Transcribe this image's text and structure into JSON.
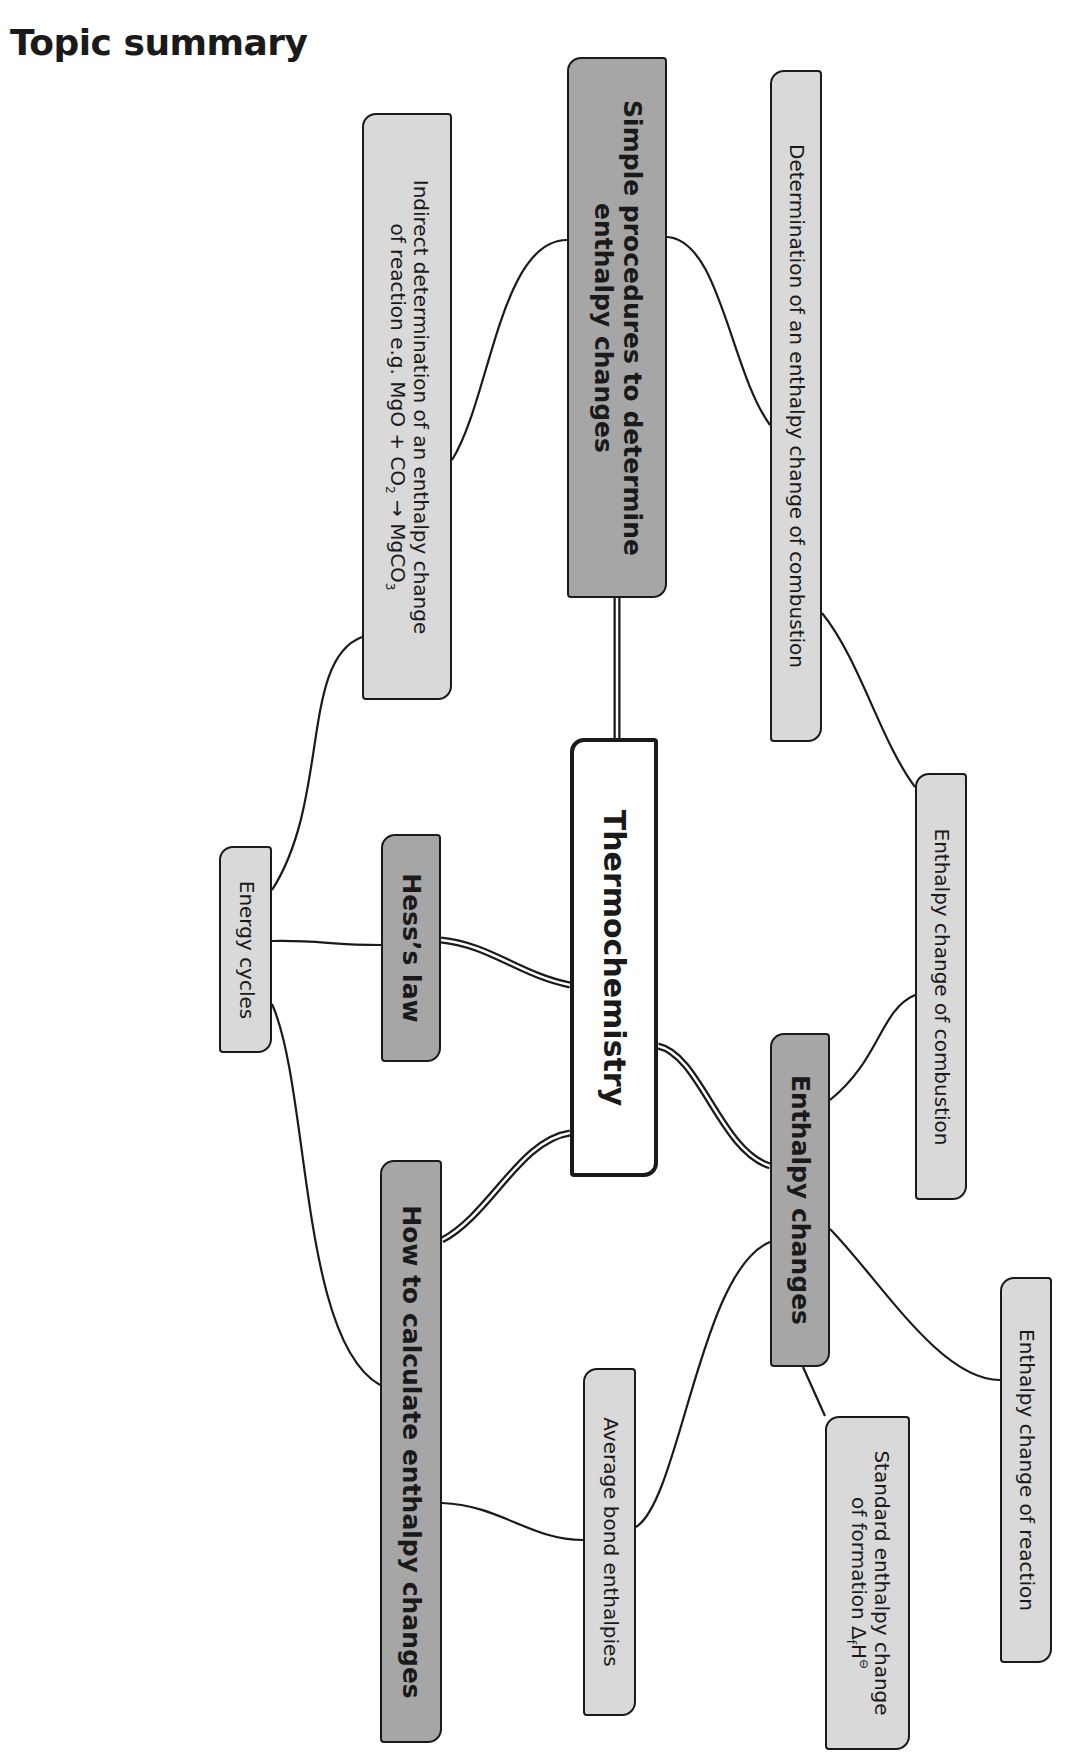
{
  "page": {
    "title": "Topic summary"
  },
  "colors": {
    "dark_node": "#a6a6a6",
    "light_node": "#d9d9d9",
    "main_node": "#ffffff",
    "line": "#1a1a1a"
  },
  "diagram": {
    "central": {
      "label": "Thermochemistry"
    },
    "nodes": {
      "simple_procedures": {
        "line1": "Simple procedures to determine",
        "line2": "enthalpy changes"
      },
      "determination_combustion": {
        "label": "Determination of an enthalpy change of combustion"
      },
      "indirect_determination": {
        "line1": "Indirect determination of an enthalpy change",
        "line2_pre": "of reaction e.g. MgO + CO",
        "line2_sub": "2",
        "line2_arrow": " → MgCO",
        "line2_sub2": "3"
      },
      "enthalpy_change_combustion": {
        "label": "Enthalpy change of combustion"
      },
      "energy_cycles": {
        "label": "Energy cycles"
      },
      "hess_law": {
        "label": "Hess’s law"
      },
      "enthalpy_changes": {
        "label": "Enthalpy changes"
      },
      "how_to_calculate": {
        "label": "How to calculate enthalpy changes"
      },
      "average_bond": {
        "label": "Average bond enthalpies"
      },
      "enthalpy_change_reaction": {
        "label": "Enthalpy change of reaction"
      },
      "standard_formation": {
        "line1": "Standard enthalpy change",
        "line2_pre": "of formation Δ",
        "line2_sub": "f",
        "line2_mid": "H",
        "line2_sup": "⊖"
      }
    },
    "connections": [
      [
        "thermochemistry",
        "simple_procedures"
      ],
      [
        "thermochemistry",
        "hess_law"
      ],
      [
        "thermochemistry",
        "how_to_calculate"
      ],
      [
        "thermochemistry",
        "enthalpy_changes"
      ],
      [
        "simple_procedures",
        "indirect_determination"
      ],
      [
        "simple_procedures",
        "determination_combustion"
      ],
      [
        "determination_combustion",
        "enthalpy_change_combustion"
      ],
      [
        "indirect_determination",
        "energy_cycles"
      ],
      [
        "energy_cycles",
        "hess_law"
      ],
      [
        "energy_cycles",
        "how_to_calculate"
      ],
      [
        "enthalpy_changes",
        "enthalpy_change_combustion"
      ],
      [
        "enthalpy_changes",
        "enthalpy_change_reaction"
      ],
      [
        "enthalpy_changes",
        "standard_formation"
      ],
      [
        "enthalpy_changes",
        "average_bond"
      ],
      [
        "how_to_calculate",
        "average_bond"
      ]
    ]
  }
}
